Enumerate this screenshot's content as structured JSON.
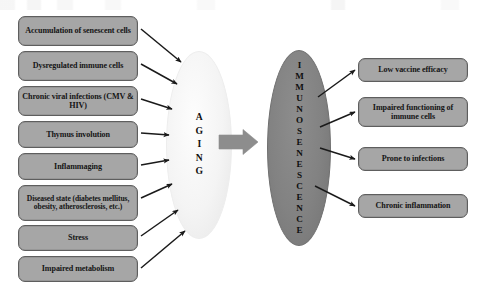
{
  "diagram": {
    "background_color": "#ffffff",
    "node_fill": "#a6a6a6",
    "node_border": "#5e5e5e",
    "aging_ellipse_fill": "#f2f2f2",
    "immuno_ellipse_fill": "#828282",
    "arrow_color": "#1a1a1a",
    "block_arrow_color": "#8a8a8a"
  },
  "causes": {
    "heading": "Drivers of aging",
    "items": [
      {
        "id": "accumulation-of-senescent-cells",
        "label": "Accumulation of senescent cells"
      },
      {
        "id": "dysregulated-immune-cells",
        "label": "Dysregulated immune cells"
      },
      {
        "id": "chronic-viral-infections",
        "label": "Chronic viral infections (CMV & HIV)"
      },
      {
        "id": "thymus-involution",
        "label": "Thymus involution"
      },
      {
        "id": "inflammaging",
        "label": "Inflammaging"
      },
      {
        "id": "diseased-state",
        "label": "Diseased state (diabetes mellitus, obesity, atherosclerosis, etc.)"
      },
      {
        "id": "stress",
        "label": "Stress"
      },
      {
        "id": "impaired-metabolism",
        "label": "Impaired metabolism"
      }
    ]
  },
  "center": {
    "aging_label": "AGING",
    "immunosenescence_label": "IMMUNOSENESCENCE"
  },
  "outcomes": {
    "heading": "Consequences of immunosenescence",
    "items": [
      {
        "id": "low-vaccine-efficacy",
        "label": "Low vaccine efficacy"
      },
      {
        "id": "impaired-functioning-of-immune-cells",
        "label": "Impaired functioning of immune cells"
      },
      {
        "id": "prone-to-infections",
        "label": "Prone to infections"
      },
      {
        "id": "chronic-inflammation",
        "label": "Chronic inflammation"
      }
    ]
  }
}
